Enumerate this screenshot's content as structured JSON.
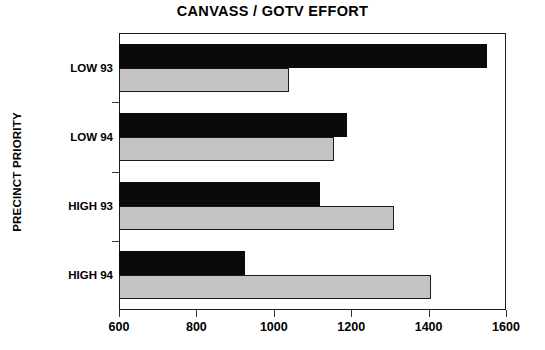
{
  "chart_data": {
    "type": "bar",
    "orientation": "horizontal",
    "title": "CANVASS / GOTV EFFORT",
    "xlabel": "",
    "ylabel": "PRECINCT PRIORITY",
    "categories": [
      "LOW 93",
      "LOW 94",
      "HIGH 93",
      "HIGH 94"
    ],
    "series": [
      {
        "name": "dark",
        "color": "#0a0a0a",
        "values": [
          1550,
          1190,
          1120,
          925
        ]
      },
      {
        "name": "light",
        "color": "#c4c4c4",
        "values": [
          1040,
          1155,
          1310,
          1405
        ]
      }
    ],
    "xlim": [
      600,
      1600
    ],
    "xticks": [
      600,
      800,
      1000,
      1200,
      1400,
      1600
    ],
    "xtick_labels": [
      "600",
      "800",
      "1000",
      "1200",
      "1400",
      "1600"
    ],
    "grid": false,
    "legend": "none",
    "frame": true
  }
}
